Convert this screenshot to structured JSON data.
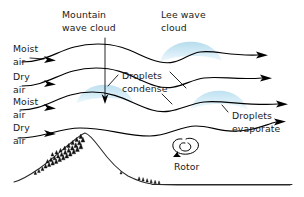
{
  "diagram": {
    "background_color": "#ffffff",
    "line_color": "#000000",
    "cloud_color": "#c7e4f2",
    "cloud_color_light": "#e3f2fa",
    "text_color": "#1a1a1a"
  },
  "labels": {
    "mountain_wave_cloud_line1": "Mountain",
    "mountain_wave_cloud_line2": "wave cloud",
    "lee_wave_cloud_line1": "Lee wave",
    "lee_wave_cloud_line2": "cloud",
    "droplets_condense_line1": "Droplets",
    "droplets_condense_line2": "condense",
    "droplets_evaporate_line1": "Droplets",
    "droplets_evaporate_line2": "evaporate",
    "rotor": "Rotor",
    "air_layers": [
      {
        "name": "moist-air-1",
        "line1": "Moist",
        "line2": "air"
      },
      {
        "name": "dry-air-1",
        "line1": "Dry",
        "line2": "air"
      },
      {
        "name": "moist-air-2",
        "line1": "Moist",
        "line2": "air"
      },
      {
        "name": "dry-air-2",
        "line1": "Dry",
        "line2": "air"
      }
    ]
  },
  "elements": {
    "streamlines_count": 4,
    "clouds_count": 3,
    "rotor_count": 1,
    "mountain_peak": "left-of-center",
    "ground_line": "bottom"
  }
}
